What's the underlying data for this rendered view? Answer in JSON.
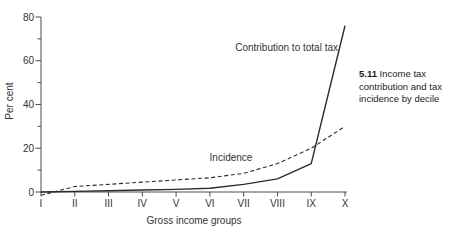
{
  "chart_data": {
    "type": "line",
    "title": "",
    "categories": [
      "I",
      "II",
      "III",
      "IV",
      "V",
      "VI",
      "VII",
      "VIII",
      "IX",
      "X"
    ],
    "xlabel": "Gross income groups",
    "ylabel": "Per cent",
    "ylim": [
      0,
      80
    ],
    "y_major_ticks": [
      0,
      20,
      40,
      60,
      80
    ],
    "y_minor_ticks": [
      10,
      30,
      50,
      70
    ],
    "grid": false,
    "legend_position": "inline-labels",
    "line_color": "#2b2b2b",
    "axis_color": "#4d4d4d",
    "series": [
      {
        "name": "Contribution to total tax",
        "style": "solid",
        "values": [
          0,
          0.3,
          0.6,
          0.9,
          1.2,
          1.7,
          3.5,
          6,
          13,
          76
        ],
        "label_pos": {
          "x": 338,
          "y": 51,
          "anchor": "end"
        }
      },
      {
        "name": "Incidence",
        "style": "dashed",
        "values": [
          -1.5,
          2.5,
          3.5,
          4.5,
          5.5,
          6.5,
          8.5,
          13,
          20,
          30
        ],
        "label_pos": {
          "x": 231,
          "y": 161,
          "anchor": "middle"
        }
      }
    ]
  },
  "caption": {
    "number": "5.11",
    "text": "Income tax contribution and tax incidence by decile"
  }
}
